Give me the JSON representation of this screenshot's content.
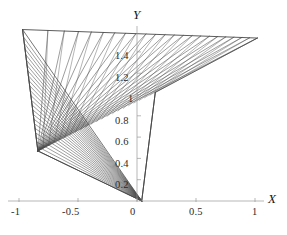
{
  "figure": {
    "kind": "line-family-envelope-plot",
    "background_color": "#ffffff",
    "line_color": "#4a4a4a",
    "axis_color": "#8a8a8a",
    "text_color": "#1a1a1a"
  },
  "axes": {
    "x": {
      "title": "X",
      "ticks": [
        {
          "label": "-1",
          "value": -1
        },
        {
          "label": "-0.5",
          "value": -0.5
        },
        {
          "label": "0",
          "value": 0
        },
        {
          "label": "0.5",
          "value": 0.5
        },
        {
          "label": "1",
          "value": 1
        }
      ],
      "range": [
        -1.12,
        1.12
      ]
    },
    "y": {
      "title": "Y",
      "ticks": [
        {
          "label": "0.2",
          "value": 0.2
        },
        {
          "label": "0.4",
          "value": 0.4
        },
        {
          "label": "0.6",
          "value": 0.6
        },
        {
          "label": "0.8",
          "value": 0.8
        },
        {
          "label": "1",
          "value": 1.0
        },
        {
          "label": "1.2",
          "value": 1.2
        },
        {
          "label": "1.4",
          "value": 1.4
        }
      ],
      "range": [
        0,
        1.62
      ]
    }
  },
  "chart_data": {
    "type": "line",
    "title": "",
    "xlabel": "X",
    "ylabel": "Y",
    "xlim": [
      -1.12,
      1.12
    ],
    "ylim": [
      0,
      1.62
    ],
    "grid": false,
    "legend": null,
    "pivots": [
      {
        "name": "lower-vertex",
        "x": 0.04,
        "y": 0.0
      },
      {
        "name": "left-vertex",
        "x": -0.84,
        "y": 0.47
      },
      {
        "name": "upper-right-focus",
        "x": 1.02,
        "y": 1.53
      },
      {
        "name": "upper-left-corner",
        "x": -0.97,
        "y": 1.61
      }
    ],
    "series": [
      {
        "name": "fan-lower",
        "count": 24,
        "note": "segments radiating from lower vertex up-left to the upper-left boundary"
      },
      {
        "name": "fan-left",
        "count": 22,
        "note": "segments radiating from left vertex up-right toward the upper-right focus"
      }
    ]
  }
}
